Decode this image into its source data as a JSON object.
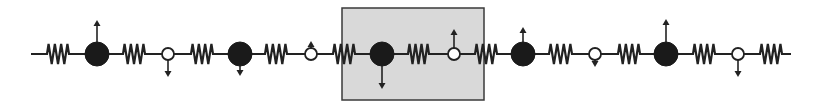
{
  "diagram": {
    "type": "1D mass-spring lattice",
    "colors": {
      "line": "#222222",
      "heavy_mass": "#1a1a1a",
      "light_mass_fill": "#ffffff",
      "unit_cell_fill": "#d9d9d9",
      "unit_cell_border": "#3a3a3a",
      "background": "#ffffff"
    },
    "baseline_y": 54,
    "chain_start_x": 31,
    "chain_end_x": 791,
    "unit_cell": {
      "x": 342,
      "y": 8,
      "width": 142,
      "height": 92,
      "label": "highlighted unit cell"
    },
    "springs": [
      {
        "x1": 44,
        "x2": 72
      },
      {
        "x1": 120,
        "x2": 148
      },
      {
        "x1": 188,
        "x2": 216
      },
      {
        "x1": 262,
        "x2": 290
      },
      {
        "x1": 330,
        "x2": 358
      },
      {
        "x1": 405,
        "x2": 432
      },
      {
        "x1": 472,
        "x2": 500
      },
      {
        "x1": 546,
        "x2": 575
      },
      {
        "x1": 615,
        "x2": 643
      },
      {
        "x1": 690,
        "x2": 718
      },
      {
        "x1": 757,
        "x2": 785
      }
    ],
    "masses": [
      {
        "kind": "heavy",
        "cx": 97,
        "r": 12,
        "arrow": "up",
        "arrow_tip_y": 20
      },
      {
        "kind": "light",
        "cx": 168,
        "r": 6,
        "arrow": "down",
        "arrow_tip_y": 77
      },
      {
        "kind": "heavy",
        "cx": 240,
        "r": 12,
        "arrow": "down",
        "arrow_tip_y": 76
      },
      {
        "kind": "light",
        "cx": 311,
        "r": 6,
        "arrow": "up",
        "arrow_tip_y": 41
      },
      {
        "kind": "heavy",
        "cx": 382,
        "r": 12,
        "arrow": "down",
        "arrow_tip_y": 89
      },
      {
        "kind": "light",
        "cx": 454,
        "r": 6,
        "arrow": "up",
        "arrow_tip_y": 29
      },
      {
        "kind": "heavy",
        "cx": 523,
        "r": 12,
        "arrow": "up",
        "arrow_tip_y": 27
      },
      {
        "kind": "light",
        "cx": 595,
        "r": 6,
        "arrow": "down",
        "arrow_tip_y": 67
      },
      {
        "kind": "heavy",
        "cx": 666,
        "r": 12,
        "arrow": "up",
        "arrow_tip_y": 19
      },
      {
        "kind": "light",
        "cx": 738,
        "r": 6,
        "arrow": "down",
        "arrow_tip_y": 77
      }
    ]
  }
}
